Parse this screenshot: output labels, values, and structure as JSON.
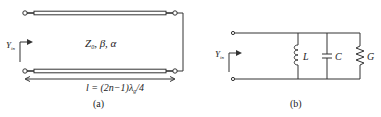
{
  "figure": {
    "panel_a": {
      "caption": "(a)",
      "line_params": "Z",
      "line_params_sub": "0",
      "line_params_rest": ", β, α",
      "input_label": "Y",
      "input_label_sub": "in",
      "length_label": "l = (2n−1)λ",
      "length_label_sub": "g",
      "length_label_rest": "/4",
      "termination": "short-circuit"
    },
    "panel_b": {
      "caption": "(b)",
      "input_label": "Y",
      "input_label_sub": "in",
      "components": [
        {
          "type": "inductor",
          "label": "L"
        },
        {
          "type": "capacitor",
          "label": "C"
        },
        {
          "type": "resistor",
          "label": "G"
        }
      ]
    },
    "colors": {
      "stroke": "#333333",
      "text": "#222222",
      "background": "#ffffff"
    }
  }
}
